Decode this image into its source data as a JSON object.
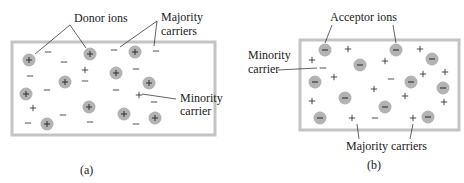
{
  "panels": [
    {
      "id": "a",
      "caption": "(a)",
      "type": "n-type",
      "labels": {
        "ions": "Donor ions",
        "majority_line1": "Majority",
        "majority_line2": "carriers",
        "minority_line1": "Minority",
        "minority_line2": "carrier"
      },
      "ion_sign": "+",
      "ions": [
        [
          29,
          60
        ],
        [
          90,
          54
        ],
        [
          135,
          52
        ],
        [
          116,
          73
        ],
        [
          65,
          82
        ],
        [
          149,
          83
        ],
        [
          26,
          94
        ],
        [
          89,
          107
        ],
        [
          124,
          114
        ],
        [
          47,
          124
        ],
        [
          155,
          118
        ]
      ],
      "majority_carriers": [
        [
          48,
          52
        ],
        [
          64,
          62
        ],
        [
          30,
          76
        ],
        [
          47,
          90
        ],
        [
          85,
          81
        ],
        [
          114,
          50
        ],
        [
          136,
          69
        ],
        [
          116,
          90
        ],
        [
          154,
          102
        ],
        [
          63,
          115
        ],
        [
          90,
          122
        ],
        [
          28,
          123
        ],
        [
          136,
          124
        ],
        [
          156,
          51
        ]
      ],
      "minority_carriers": [
        [
          85,
          70
        ],
        [
          33,
          108
        ],
        [
          139,
          95
        ]
      ]
    },
    {
      "id": "b",
      "caption": "(b)",
      "type": "p-type",
      "labels": {
        "ions": "Acceptor ions",
        "minority_line1": "Minority",
        "minority_line2": "carrier",
        "majority": "Majority carriers"
      },
      "ion_sign": "−",
      "ions": [
        [
          325,
          50
        ],
        [
          396,
          50
        ],
        [
          360,
          65
        ],
        [
          432,
          59
        ],
        [
          315,
          82
        ],
        [
          411,
          82
        ],
        [
          443,
          88
        ],
        [
          345,
          98
        ],
        [
          385,
          107
        ],
        [
          428,
          117
        ],
        [
          320,
          118
        ]
      ],
      "majority_carriers": [
        [
          348,
          49
        ],
        [
          420,
          49
        ],
        [
          312,
          60
        ],
        [
          385,
          61
        ],
        [
          334,
          77
        ],
        [
          423,
          74
        ],
        [
          445,
          72
        ],
        [
          374,
          89
        ],
        [
          405,
          96
        ],
        [
          312,
          101
        ],
        [
          444,
          102
        ],
        [
          352,
          118
        ],
        [
          413,
          118
        ]
      ],
      "minority_carriers": [
        [
          323,
          68
        ],
        [
          391,
          79
        ],
        [
          375,
          118
        ]
      ]
    }
  ],
  "colors": {
    "ion_fill": "#b3b3b3",
    "box_border": "#c4c4c4",
    "ink": "#222222"
  }
}
